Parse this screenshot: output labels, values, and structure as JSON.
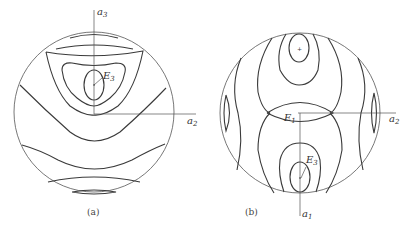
{
  "panels": [
    {
      "id": "a",
      "caption": "(a)",
      "axes": {
        "vertical": "a",
        "vertical_sub": "3",
        "horizontal": "a",
        "horizontal_sub": "2"
      },
      "points": [
        {
          "label": "E",
          "sub": "3"
        }
      ]
    },
    {
      "id": "b",
      "caption": "(b)",
      "axes": {
        "vertical": "a",
        "vertical_sub": "1",
        "horizontal": "a",
        "horizontal_sub": "2"
      },
      "points": [
        {
          "label": "E",
          "sub": "1"
        },
        {
          "label": "E",
          "sub": "3"
        }
      ]
    }
  ],
  "colors": {
    "line": "#3a3a3a",
    "background": "#ffffff"
  }
}
